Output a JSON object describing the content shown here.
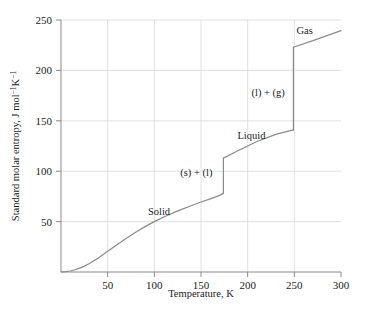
{
  "chart_data": {
    "type": "line",
    "title": "",
    "xlabel": "Temperature, K",
    "ylabel": "Standard molar entropy, J mol−1K−1",
    "ylabel_parts": {
      "lead": "Standard molar entropy, J mol",
      "sup1": "−1",
      "mid": "K",
      "sup2": "−1"
    },
    "xlim": [
      0,
      300
    ],
    "ylim": [
      0,
      250
    ],
    "xticks": [
      50,
      100,
      150,
      200,
      250,
      300
    ],
    "yticks": [
      50,
      100,
      150,
      200,
      250
    ],
    "xtick_labels": [
      "50",
      "100",
      "150",
      "200",
      "250",
      "300"
    ],
    "ytick_labels": [
      "50",
      "100",
      "150",
      "200",
      "250"
    ],
    "grid": true,
    "grid_color": "#d9d9d9",
    "line_color": "#8a8a8a",
    "legend": "none",
    "melting_point": 174,
    "boiling_point": 249,
    "entropy_of_fusion": 35,
    "entropy_of_vaporization": 82,
    "series": [
      {
        "name": "Solid",
        "x": [
          0,
          5,
          10,
          15,
          20,
          25,
          30,
          40,
          50,
          60,
          70,
          80,
          90,
          100,
          110,
          120,
          130,
          140,
          150,
          160,
          170,
          174
        ],
        "values": [
          0,
          0.3,
          1.0,
          2.2,
          3.8,
          5.8,
          8.2,
          14.0,
          20.5,
          27.0,
          33.5,
          39.5,
          45.0,
          50.0,
          54.5,
          58.6,
          62.4,
          66.0,
          69.4,
          72.6,
          76.0,
          78.0
        ]
      },
      {
        "name": "(s) + (l)",
        "x": [
          174,
          174
        ],
        "values": [
          78,
          113
        ]
      },
      {
        "name": "Liquid",
        "x": [
          174,
          190,
          210,
          230,
          249
        ],
        "values": [
          113,
          120.5,
          129.5,
          136.5,
          141.0
        ]
      },
      {
        "name": "(l) + (g)",
        "x": [
          249,
          249
        ],
        "values": [
          141,
          223
        ]
      },
      {
        "name": "Gas",
        "x": [
          249,
          270,
          300
        ],
        "values": [
          223,
          229.5,
          239.5
        ]
      }
    ],
    "annotations": [
      {
        "id": "solid",
        "text": "Solid",
        "x": 105,
        "y": 57
      },
      {
        "id": "s-plus-l",
        "text": "(s) + (l)",
        "x": 145,
        "y": 95
      },
      {
        "id": "liquid",
        "text": "Liquid",
        "x": 204,
        "y": 132
      },
      {
        "id": "l-plus-g",
        "text": "(l) + (g)",
        "x": 222,
        "y": 175
      },
      {
        "id": "gas",
        "text": "Gas",
        "x": 261,
        "y": 236
      }
    ]
  }
}
